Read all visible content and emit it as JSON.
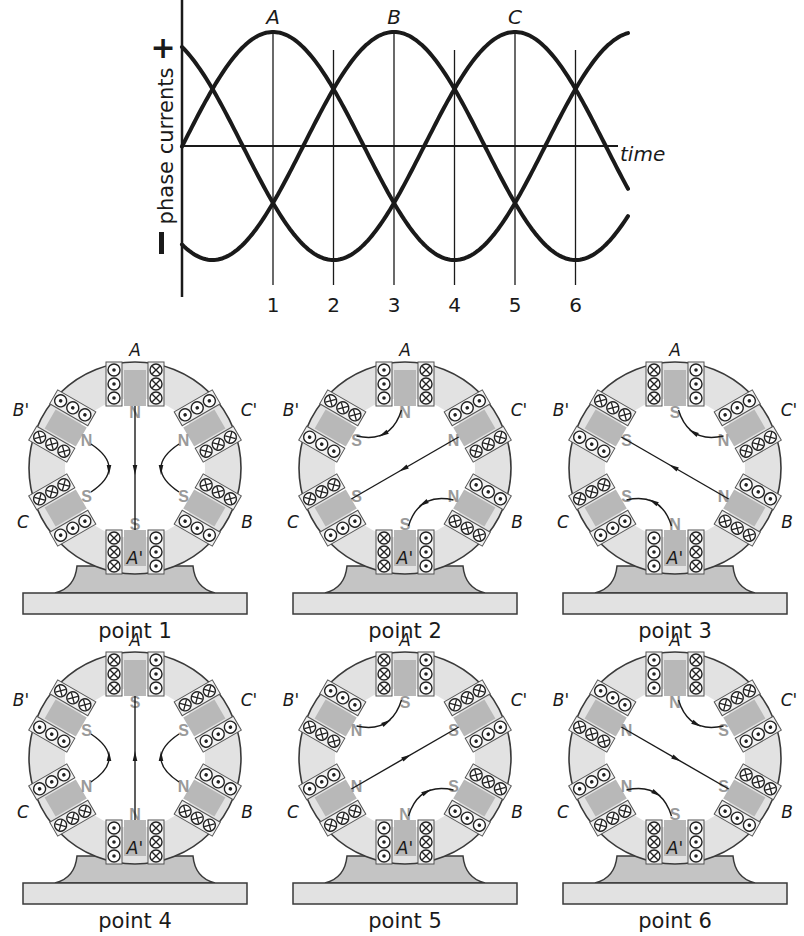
{
  "chart": {
    "ylabel": "phase currents",
    "plus_sign": "+",
    "minus_sign": "I",
    "xlabel": "time",
    "peak_labels": [
      {
        "label": "A",
        "point": 1
      },
      {
        "label": "B",
        "point": 3
      },
      {
        "label": "C",
        "point": 5
      }
    ],
    "point_labels": [
      "1",
      "2",
      "3",
      "4",
      "5",
      "6"
    ]
  },
  "chart_data": {
    "type": "line",
    "title": "",
    "xlabel": "time",
    "ylabel": "phase currents",
    "x_ticks": [
      "1",
      "2",
      "3",
      "4",
      "5",
      "6"
    ],
    "x_tick_phase_deg": [
      0,
      60,
      120,
      180,
      240,
      300
    ],
    "ylim": [
      -1,
      1
    ],
    "grid": "vertical lines at points 1-6",
    "series": [
      {
        "name": "A",
        "formula": "cos(theta)",
        "peak_at_point": 1,
        "values_at_points": [
          1.0,
          0.5,
          -0.5,
          -1.0,
          -0.5,
          0.5
        ]
      },
      {
        "name": "B",
        "formula": "cos(theta - 120deg)",
        "peak_at_point": 3,
        "values_at_points": [
          -0.5,
          0.5,
          1.0,
          0.5,
          -0.5,
          -1.0
        ]
      },
      {
        "name": "C",
        "formula": "cos(theta - 240deg)",
        "peak_at_point": 5,
        "values_at_points": [
          -0.5,
          -1.0,
          -0.5,
          0.5,
          1.0,
          0.5
        ]
      }
    ]
  },
  "motors": {
    "terminal_labels": {
      "top": "A",
      "bottom": "A'",
      "upper_left": "B'",
      "upper_right": "C'",
      "lower_left": "C",
      "lower_right": "B"
    },
    "items": [
      {
        "caption": "point 1",
        "coils": {
          "A_left": "x",
          "A_right": "o",
          "Ap_left": "x",
          "Ap_right": "o",
          "Bp_outer": "o",
          "Bp_inner": "x",
          "C_inner": "x",
          "C_outer": "o",
          "Cp_outer": "x",
          "Cp_inner": "o",
          "B_inner": "o",
          "B_outer": "x"
        },
        "poles": {
          "top": "N",
          "bottom": "S",
          "upper_left": "N",
          "lower_left": "S",
          "upper_right": "N",
          "lower_right": "S"
        },
        "field_angle_deg": 270,
        "side_arrows": "down"
      },
      {
        "caption": "point 2",
        "coils": {
          "A_left": "x",
          "A_right": "o",
          "Ap_left": "x",
          "Ap_right": "o",
          "Bp_outer": "x",
          "Bp_inner": "o",
          "C_inner": "x",
          "C_outer": "o",
          "Cp_outer": "x",
          "Cp_inner": "o",
          "B_inner": "x",
          "B_outer": "o"
        },
        "poles": {
          "top": "N",
          "bottom": "S",
          "upper_left": "S",
          "lower_left": "S",
          "upper_right": "N",
          "lower_right": "N"
        },
        "field_angle_deg": 210,
        "side_arrows": "ccw"
      },
      {
        "caption": "point 3",
        "coils": {
          "A_left": "o",
          "A_right": "x",
          "Ap_left": "o",
          "Ap_right": "x",
          "Bp_outer": "x",
          "Bp_inner": "o",
          "C_inner": "x",
          "C_outer": "o",
          "Cp_outer": "x",
          "Cp_inner": "o",
          "B_inner": "x",
          "B_outer": "o"
        },
        "poles": {
          "top": "S",
          "bottom": "N",
          "upper_left": "S",
          "lower_left": "S",
          "upper_right": "N",
          "lower_right": "N"
        },
        "field_angle_deg": 150,
        "side_arrows": "ccw"
      },
      {
        "caption": "point 4",
        "coils": {
          "A_left": "o",
          "A_right": "x",
          "Ap_left": "o",
          "Ap_right": "x",
          "Bp_outer": "x",
          "Bp_inner": "o",
          "C_inner": "o",
          "C_outer": "x",
          "Cp_outer": "o",
          "Cp_inner": "x",
          "B_inner": "x",
          "B_outer": "o"
        },
        "poles": {
          "top": "S",
          "bottom": "N",
          "upper_left": "S",
          "lower_left": "N",
          "upper_right": "S",
          "lower_right": "N"
        },
        "field_angle_deg": 90,
        "side_arrows": "up"
      },
      {
        "caption": "point 5",
        "coils": {
          "A_left": "o",
          "A_right": "x",
          "Ap_left": "o",
          "Ap_right": "x",
          "Bp_outer": "o",
          "Bp_inner": "x",
          "C_inner": "o",
          "C_outer": "x",
          "Cp_outer": "o",
          "Cp_inner": "x",
          "B_inner": "o",
          "B_outer": "x"
        },
        "poles": {
          "top": "S",
          "bottom": "N",
          "upper_left": "N",
          "lower_left": "N",
          "upper_right": "S",
          "lower_right": "S"
        },
        "field_angle_deg": 30,
        "side_arrows": "ccw"
      },
      {
        "caption": "point 6",
        "coils": {
          "A_left": "x",
          "A_right": "o",
          "Ap_left": "x",
          "Ap_right": "o",
          "Bp_outer": "o",
          "Bp_inner": "x",
          "C_inner": "o",
          "C_outer": "x",
          "Cp_outer": "o",
          "Cp_inner": "x",
          "B_inner": "o",
          "B_outer": "x"
        },
        "poles": {
          "top": "N",
          "bottom": "S",
          "upper_left": "N",
          "lower_left": "N",
          "upper_right": "S",
          "lower_right": "S"
        },
        "field_angle_deg": 330,
        "side_arrows": "ccw"
      }
    ]
  },
  "colors": {
    "ink": "#1a1a1a",
    "stator_fill": "#e2e2e2",
    "stator_stroke": "#3a3a3a",
    "pole_shade": "#b8b8b8",
    "foot_fill": "#c4c4c4",
    "base_fill": "#e2e2e2",
    "pole_letter": "#9a9a9a"
  }
}
